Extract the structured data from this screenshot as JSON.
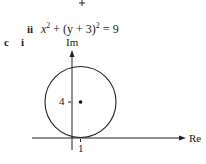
{
  "part_ii_label": "ii",
  "equation": {
    "x": "x",
    "exp1": "2",
    "mid": " + (y + 3)",
    "exp2": "2",
    "rhs": " = 9"
  },
  "part_c_label": "c",
  "part_i_label": "i",
  "diagram": {
    "imag_axis_label": "Im",
    "real_axis_label": "Re",
    "y_tick_label": "4",
    "x_tick_label": "1",
    "circle_center": [
      1,
      4
    ],
    "circle_radius": 4
  }
}
